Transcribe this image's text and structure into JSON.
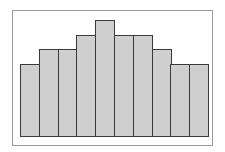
{
  "chart_data": {
    "type": "bar",
    "title": "",
    "xlabel": "",
    "ylabel": "",
    "categories": [
      "1",
      "2",
      "3",
      "4",
      "5",
      "6",
      "7",
      "8",
      "9",
      "10"
    ],
    "values": [
      5,
      6,
      6,
      7,
      8,
      7,
      7,
      6,
      5,
      5
    ],
    "ylim": [
      0,
      8.5
    ],
    "grid": false,
    "legend": null,
    "colors": {
      "bar_fill": "#cfcfcf",
      "bar_edge": "#3a3a3a",
      "frame": "#9a9a9a",
      "background": "#ffffff"
    }
  }
}
